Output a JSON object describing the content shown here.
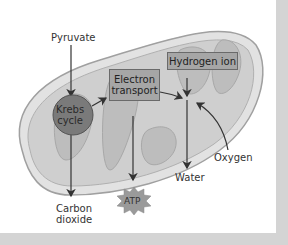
{
  "diagram": {
    "inputs": {
      "pyruvate": "Pyruvate",
      "oxygen": "Oxygen"
    },
    "processes": {
      "krebs_line1": "Krebs",
      "krebs_line2": "cycle",
      "electron_line1": "Electron",
      "electron_line2": "transport",
      "hydrogen_ion": "Hydrogen ion"
    },
    "outputs": {
      "carbon_line1": "Carbon",
      "carbon_line2": "dioxide",
      "water": "Water",
      "atp": "ATP"
    },
    "colors": {
      "outer_membrane": "#dcdcdc",
      "inner_matrix": "#c8c8c8",
      "cristae": "#b5b5b5",
      "krebs_circle": "#7a7a7a",
      "box_fill": "#a6a6a6",
      "atp_burst": "#9a9a9a",
      "frame": "#d4d4d4"
    }
  }
}
